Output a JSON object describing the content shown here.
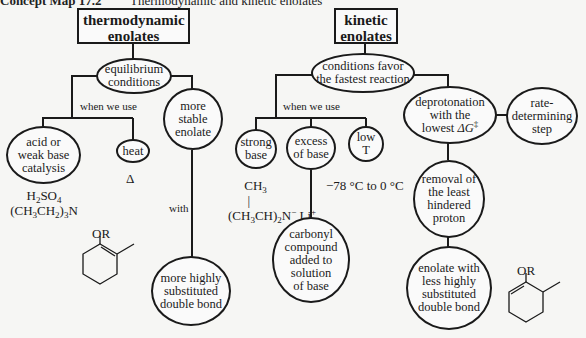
{
  "header": {
    "label": "Concept Map 17.2",
    "title": "Thermodynamic and kinetic enolates"
  },
  "thermodynamic": {
    "title": "thermodynamic\nenolates",
    "root": "equilibrium\nconditions",
    "when_label": "when we use",
    "conditions": [
      {
        "text": "acid or\nweak base\ncatalysis",
        "example": "H2SO4 / (CH3CH2)3N"
      },
      {
        "text": "heat",
        "example": "Δ"
      }
    ],
    "result": "more\nstable\nenolate",
    "with_label": "with",
    "final": "more highly\nsubstituted\ndouble bond",
    "structure_label": "OR"
  },
  "kinetic": {
    "title": "kinetic\nenolates",
    "root": "conditions favor\nthe fastest reaction",
    "when_label": "when we use",
    "conditions": [
      {
        "text": "strong\nbase",
        "example": "((CH3)2CH)2N⁻ Li⁺"
      },
      {
        "text": "excess\nof base",
        "example": "carbonyl\ncompound\nadded to\nsolution\nof base"
      },
      {
        "text": "low\nT",
        "example": "−78 °C to 0 °C"
      }
    ],
    "deprotonation": "deprotonation\nwith the\nlowest ΔG‡",
    "rate_step": "rate-\ndetermining\nstep",
    "removal": "removal of\nthe least\nhindered\nproton",
    "final": "enolate with\nless highly\nsubstituted\ndouble bond",
    "structure_label": "OR"
  }
}
